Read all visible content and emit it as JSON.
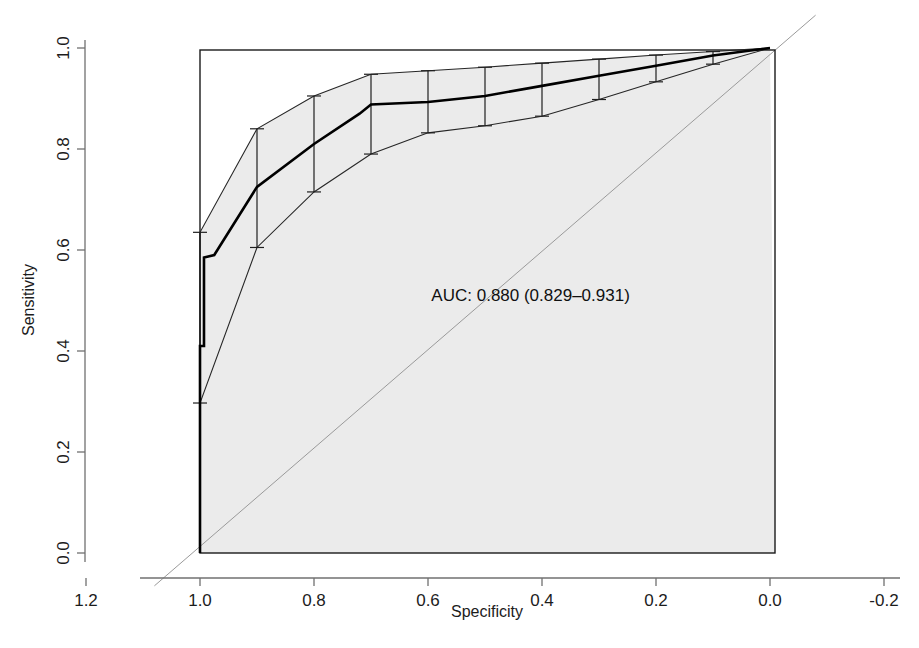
{
  "chart_data": {
    "type": "line",
    "title": "",
    "subtitle": "",
    "xlabel": "Specificity",
    "ylabel": "Sensitivity",
    "xlim": [
      1.2,
      -0.2
    ],
    "ylim": [
      0.0,
      1.0
    ],
    "x_ticks": [
      "1.2",
      "1.0",
      "0.8",
      "0.6",
      "0.4",
      "0.2",
      "0.0",
      "-0.2"
    ],
    "x_tick_values": [
      1.2,
      1.0,
      0.8,
      0.6,
      0.4,
      0.2,
      0.0,
      -0.2
    ],
    "y_ticks": [
      "0.0",
      "0.2",
      "0.4",
      "0.6",
      "0.8",
      "1.0"
    ],
    "y_tick_values": [
      0.0,
      0.2,
      0.4,
      0.6,
      0.8,
      1.0
    ],
    "grid": false,
    "legend": "none",
    "x_axis_reversed": true,
    "annotations": [
      {
        "name": "auc-annotation",
        "text": "AUC: 0.880 (0.829–0.931)",
        "x": 0.42,
        "y": 0.5
      }
    ],
    "series": [
      {
        "name": "ROC curve",
        "type": "step",
        "color": "#000000",
        "width": 2.6,
        "points": [
          {
            "specificity": 1.0,
            "sensitivity": 0.0
          },
          {
            "specificity": 1.0,
            "sensitivity": 0.41
          },
          {
            "specificity": 0.993,
            "sensitivity": 0.41
          },
          {
            "specificity": 0.993,
            "sensitivity": 0.585
          },
          {
            "specificity": 0.975,
            "sensitivity": 0.59
          },
          {
            "specificity": 0.9,
            "sensitivity": 0.725
          },
          {
            "specificity": 0.8,
            "sensitivity": 0.81
          },
          {
            "specificity": 0.72,
            "sensitivity": 0.87
          },
          {
            "specificity": 0.7,
            "sensitivity": 0.888
          },
          {
            "specificity": 0.6,
            "sensitivity": 0.893
          },
          {
            "specificity": 0.5,
            "sensitivity": 0.905
          },
          {
            "specificity": 0.4,
            "sensitivity": 0.925
          },
          {
            "specificity": 0.3,
            "sensitivity": 0.945
          },
          {
            "specificity": 0.2,
            "sensitivity": 0.965
          },
          {
            "specificity": 0.1,
            "sensitivity": 0.985
          },
          {
            "specificity": 0.0,
            "sensitivity": 1.0
          }
        ]
      },
      {
        "name": "Upper 95% CI bound",
        "type": "line",
        "color": "#262626",
        "width": 1.1,
        "points": [
          {
            "specificity": 1.0,
            "sensitivity": 0.0
          },
          {
            "specificity": 1.0,
            "sensitivity": 0.635
          },
          {
            "specificity": 0.9,
            "sensitivity": 0.84
          },
          {
            "specificity": 0.8,
            "sensitivity": 0.905
          },
          {
            "specificity": 0.7,
            "sensitivity": 0.948
          },
          {
            "specificity": 0.6,
            "sensitivity": 0.955
          },
          {
            "specificity": 0.5,
            "sensitivity": 0.962
          },
          {
            "specificity": 0.4,
            "sensitivity": 0.97
          },
          {
            "specificity": 0.3,
            "sensitivity": 0.978
          },
          {
            "specificity": 0.2,
            "sensitivity": 0.986
          },
          {
            "specificity": 0.1,
            "sensitivity": 0.993
          },
          {
            "specificity": 0.0,
            "sensitivity": 1.0
          }
        ]
      },
      {
        "name": "Lower 95% CI bound",
        "type": "line",
        "color": "#262626",
        "width": 1.1,
        "points": [
          {
            "specificity": 1.0,
            "sensitivity": 0.0
          },
          {
            "specificity": 1.0,
            "sensitivity": 0.297
          },
          {
            "specificity": 0.9,
            "sensitivity": 0.605
          },
          {
            "specificity": 0.8,
            "sensitivity": 0.715
          },
          {
            "specificity": 0.7,
            "sensitivity": 0.79
          },
          {
            "specificity": 0.6,
            "sensitivity": 0.832
          },
          {
            "specificity": 0.5,
            "sensitivity": 0.846
          },
          {
            "specificity": 0.4,
            "sensitivity": 0.865
          },
          {
            "specificity": 0.3,
            "sensitivity": 0.898
          },
          {
            "specificity": 0.2,
            "sensitivity": 0.933
          },
          {
            "specificity": 0.1,
            "sensitivity": 0.968
          },
          {
            "specificity": 0.0,
            "sensitivity": 1.0
          }
        ]
      },
      {
        "name": "Chance diagonal",
        "type": "line",
        "color": "#9a9a9a",
        "width": 1.0,
        "points": [
          {
            "specificity": 1.08,
            "sensitivity": -0.065
          },
          {
            "specificity": -0.08,
            "sensitivity": 1.065
          }
        ]
      }
    ],
    "error_bars": [
      {
        "specificity": 1.0,
        "low": 0.297,
        "high": 0.635
      },
      {
        "specificity": 0.9,
        "low": 0.605,
        "high": 0.84
      },
      {
        "specificity": 0.8,
        "low": 0.715,
        "high": 0.905
      },
      {
        "specificity": 0.7,
        "low": 0.79,
        "high": 0.948
      },
      {
        "specificity": 0.6,
        "low": 0.832,
        "high": 0.955
      },
      {
        "specificity": 0.5,
        "low": 0.846,
        "high": 0.962
      },
      {
        "specificity": 0.4,
        "low": 0.865,
        "high": 0.97
      },
      {
        "specificity": 0.3,
        "low": 0.898,
        "high": 0.978
      },
      {
        "specificity": 0.2,
        "low": 0.933,
        "high": 0.986
      },
      {
        "specificity": 0.1,
        "low": 0.968,
        "high": 0.993
      }
    ],
    "shaded_region": {
      "name": "confidence-band-and-area-under-curve",
      "fill": "#ebebeb",
      "description": "grey shading filling the plot box below the upper confidence bound"
    },
    "colors": {
      "curve": "#000000",
      "ci_band": "#262626",
      "shading": "#ebebeb",
      "diagonal": "#9a9a9a",
      "box": "#1a1a1a",
      "axis": "#707070",
      "text": "#1c1c1c",
      "background": "#ffffff"
    },
    "geometry": {
      "plot_left": 200,
      "plot_right": 775,
      "plot_top": 50,
      "plot_bottom": 553,
      "axis_x_left": 140,
      "axis_x_right": 900,
      "axis_y_line_x": 85,
      "axis_x_line_y": 578,
      "x_at_spec_1": 200,
      "x_at_spec_0": 770,
      "y_at_sens_1": 48,
      "y_at_sens_0": 553
    }
  }
}
